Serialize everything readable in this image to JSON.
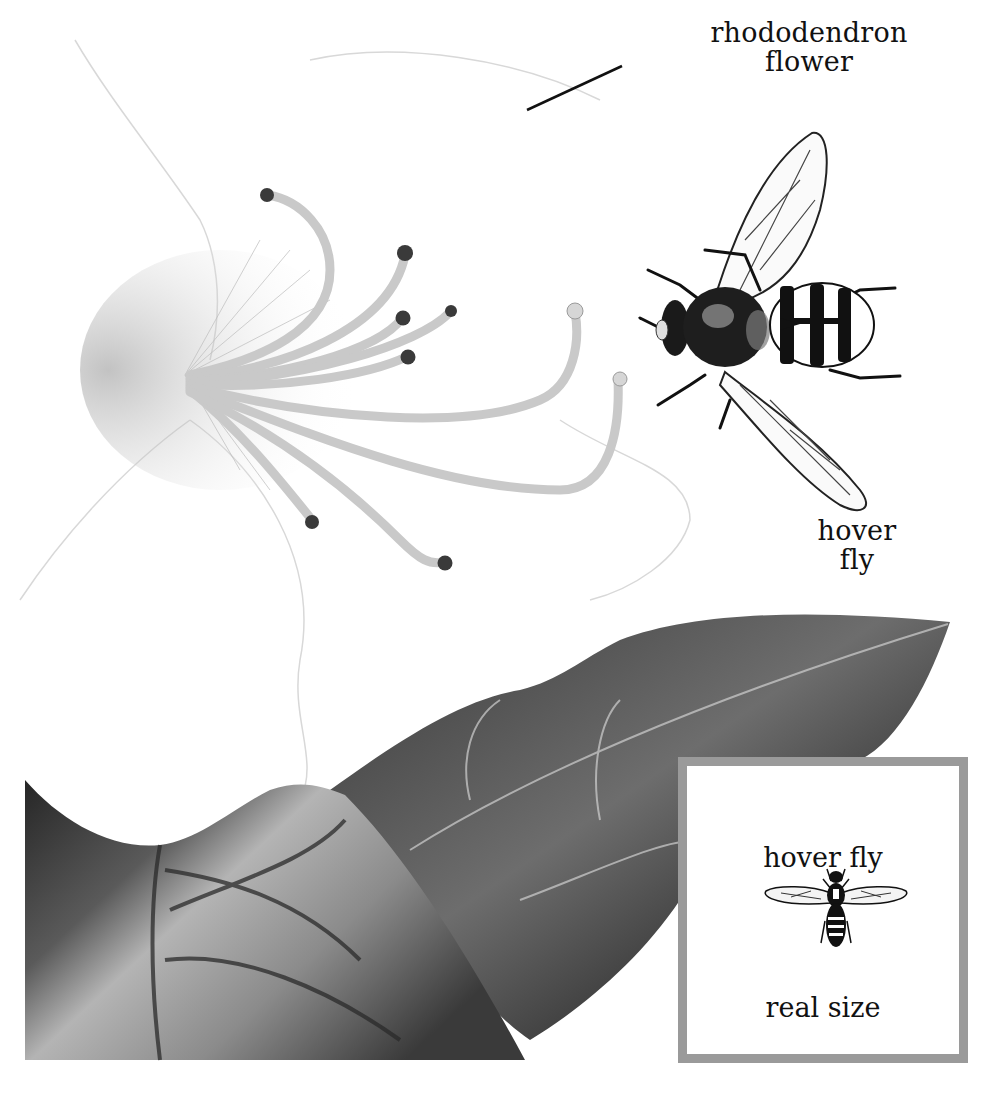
{
  "illustration": {
    "subject": "hover fly visiting rhododendron flower",
    "palette": {
      "background": "#ffffff",
      "ink": "#111111",
      "leaf_dark": "#2a2a2a",
      "leaf_mid": "#6e6e6e",
      "leaf_light": "#bdbdbd",
      "stamen": "#cfcfcf",
      "anther": "#3a3a3a",
      "inset_border": "#9a9a9a"
    }
  },
  "labels": {
    "flower": {
      "line1": "rhododendron",
      "line2": "flower"
    },
    "fly": {
      "line1": "hover",
      "line2": "fly"
    }
  },
  "inset": {
    "title": "hover fly",
    "caption": "real size",
    "icon": "hover-fly-icon"
  }
}
